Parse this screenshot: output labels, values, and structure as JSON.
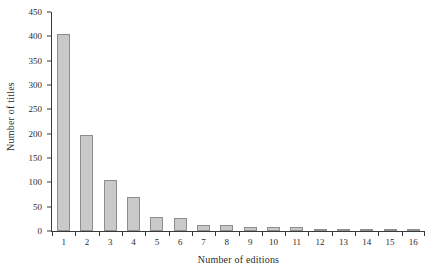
{
  "chart_data": {
    "type": "bar",
    "title": "",
    "xlabel": "Number of editions",
    "ylabel": "Number of titles",
    "categories": [
      "1",
      "2",
      "3",
      "4",
      "5",
      "6",
      "7",
      "8",
      "9",
      "10",
      "11",
      "12",
      "13",
      "14",
      "15",
      "16"
    ],
    "values": [
      404,
      197,
      105,
      70,
      29,
      27,
      13,
      13,
      8,
      8,
      8,
      4,
      1,
      5,
      1,
      5
    ],
    "ylim": [
      0,
      450
    ],
    "ytick_labels": [
      "0",
      "50",
      "100",
      "150",
      "200",
      "250",
      "300",
      "350",
      "400",
      "450"
    ],
    "ytick_values": [
      0,
      50,
      100,
      150,
      200,
      250,
      300,
      350,
      400,
      450
    ],
    "grid": false,
    "legend": null,
    "bar_fill_color": "#c9c9c9",
    "bar_border_color": "#8d8d8d",
    "axis_color": "#3a3a3a",
    "background_color": "#ffffff"
  }
}
